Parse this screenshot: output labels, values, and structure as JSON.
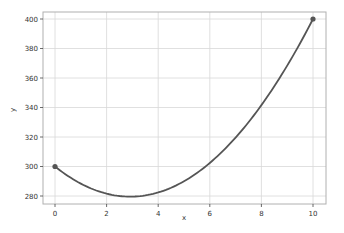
{
  "chart_data": {
    "type": "line",
    "title": "",
    "xlabel": "x",
    "ylabel": "y",
    "xlim": [
      -0.5,
      10.5
    ],
    "ylim": [
      274,
      406
    ],
    "xticks": [
      0,
      2,
      4,
      6,
      8,
      10
    ],
    "yticks": [
      280,
      300,
      320,
      340,
      360,
      380,
      400
    ],
    "grid": true,
    "legend": null,
    "series": [
      {
        "name": "y",
        "color": "#555555",
        "x": [
          0,
          1,
          2,
          3,
          4,
          5,
          6,
          7,
          8,
          9,
          10
        ],
        "values": [
          300,
          288.4,
          281.6,
          279.6,
          282.4,
          290,
          302.4,
          319.6,
          341.6,
          368.4,
          400
        ],
        "markers_at_endpoints": [
          [
            0,
            300
          ],
          [
            10,
            400
          ]
        ]
      }
    ]
  },
  "labels": {
    "xlabel": "x",
    "ylabel": "y",
    "xticks": [
      "0",
      "2",
      "4",
      "6",
      "8",
      "10"
    ],
    "yticks": [
      "280",
      "300",
      "320",
      "340",
      "360",
      "380",
      "400"
    ]
  }
}
